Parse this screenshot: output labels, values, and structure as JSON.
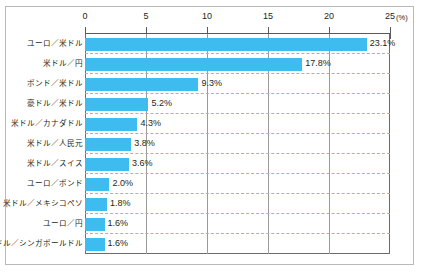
{
  "chart_data": {
    "type": "bar",
    "orientation": "horizontal",
    "title": "",
    "xlabel": "",
    "ylabel": "",
    "unit_label": "(%)",
    "xlim": [
      0,
      25
    ],
    "xticks": [
      0,
      5,
      10,
      15,
      20,
      25
    ],
    "xtick_labels": [
      "0",
      "5",
      "10",
      "15",
      "20",
      "25"
    ],
    "grid": "vertical solid, horizontal dashed between rows",
    "legend": "none",
    "bar_color": "#3fbcef",
    "categories": [
      "ユーロ／米ドル",
      "米ドル／円",
      "ポンド／米ドル",
      "豪ドル／米ドル",
      "米ドル／カナダドル",
      "米ドル／人民元",
      "米ドル／スイス",
      "ユーロ／ポンド",
      "米ドル／メキシコペソ",
      "ユーロ／円",
      "米ドル／シンガポールドル"
    ],
    "values": [
      23.1,
      17.8,
      9.3,
      5.2,
      4.3,
      3.8,
      3.6,
      2.0,
      1.8,
      1.6,
      1.6
    ],
    "value_labels": [
      "23.1%",
      "17.8%",
      "9.3%",
      "5.2%",
      "4.3%",
      "3.8%",
      "3.6%",
      "2.0%",
      "1.8%",
      "1.6%",
      "1.6%"
    ]
  }
}
